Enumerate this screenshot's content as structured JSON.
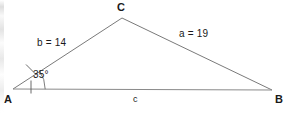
{
  "figure": {
    "type": "triangle-diagram",
    "background_color": "#ffffff",
    "line_color": "#808080",
    "text_color": "#1a1a1a"
  },
  "vertices": [
    {
      "name": "A",
      "label": "A",
      "x": 13,
      "y": 89,
      "label_x": 5,
      "label_y": 95
    },
    {
      "name": "B",
      "label": "B",
      "x": 272,
      "y": 90,
      "label_x": 276,
      "label_y": 95
    },
    {
      "name": "C",
      "label": "C",
      "x": 122,
      "y": 18,
      "label_x": 117,
      "label_y": 2
    }
  ],
  "sides": [
    {
      "name": "side-a",
      "label": "a = 19",
      "from": "C",
      "to": "B",
      "label_x": 179,
      "label_y": 31,
      "length": 19,
      "variable": "a"
    },
    {
      "name": "side-b",
      "label": "b = 14",
      "from": "A",
      "to": "C",
      "label_x": 37,
      "label_y": 39,
      "length": 14,
      "variable": "b"
    },
    {
      "name": "side-c",
      "label": "c",
      "from": "A",
      "to": "B",
      "label_x": 133,
      "label_y": 96,
      "length": null,
      "variable": "c"
    }
  ],
  "angles": [
    {
      "name": "angle-A",
      "at_vertex": "A",
      "label": "35°",
      "value": 35,
      "unit": "degrees",
      "label_x": 33,
      "label_y": 72,
      "has_arc": true,
      "has_tick_mark": true
    }
  ]
}
